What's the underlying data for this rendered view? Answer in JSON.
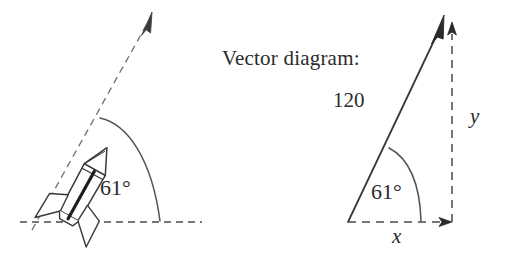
{
  "figure": {
    "background_color": "#ffffff",
    "ink_color": "#3a3a3a",
    "panels": [
      {
        "name": "rocket-launch-panel",
        "description": "rocket tilted at 61 degrees above horizontal ground line with dashed trajectory arrow",
        "angle_label": "61°",
        "angle_degrees": 61
      },
      {
        "name": "vector-diagram-panel",
        "description": "vector of magnitude 120 at 61 degrees with dashed x and y components",
        "heading": "Vector diagram:",
        "magnitude_label": "120",
        "angle_label": "61°",
        "angle_degrees": 61,
        "x_component_label": "x",
        "y_component_label": "y"
      }
    ]
  },
  "left": {
    "angle_label": "61°"
  },
  "right": {
    "heading": "Vector diagram:",
    "magnitude_label": "120",
    "angle_label": "61°",
    "x_label": "x",
    "y_label": "y"
  }
}
